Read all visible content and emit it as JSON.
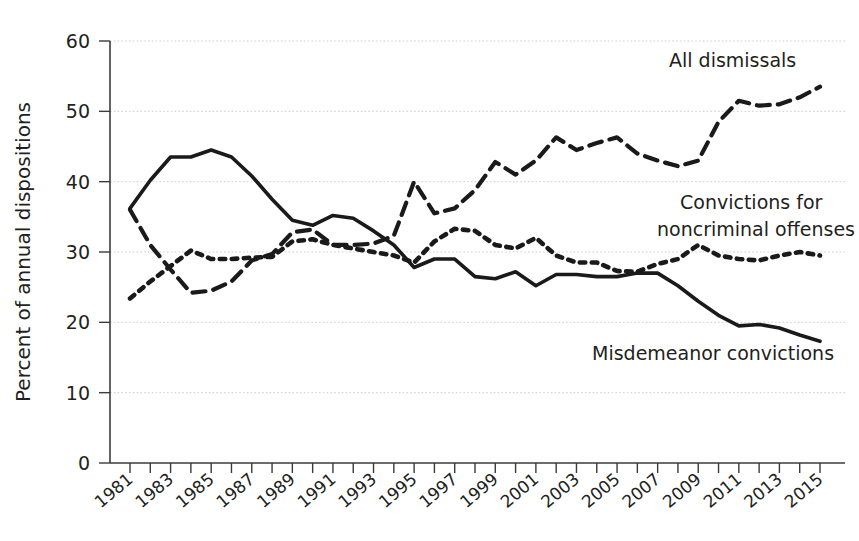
{
  "chart_data": {
    "type": "line",
    "title": "",
    "xlabel": "",
    "ylabel": "Percent of annual dispositions",
    "ylim": [
      0,
      60
    ],
    "yticks": [
      0,
      10,
      20,
      30,
      40,
      50,
      60
    ],
    "xlim": [
      1981,
      2015
    ],
    "grid": true,
    "legend_position": "inline-annotations",
    "x": [
      1981,
      1982,
      1983,
      1984,
      1985,
      1986,
      1987,
      1988,
      1989,
      1990,
      1991,
      1992,
      1993,
      1994,
      1995,
      1996,
      1997,
      1998,
      1999,
      2000,
      2001,
      2002,
      2003,
      2004,
      2005,
      2006,
      2007,
      2008,
      2009,
      2010,
      2011,
      2012,
      2013,
      2014,
      2015
    ],
    "xtick_labels": [
      "1981",
      "1982",
      "1983",
      "1984",
      "1985",
      "1986",
      "1987",
      "1988",
      "1989",
      "1990",
      "1991",
      "1992",
      "1993",
      "1994",
      "1995",
      "1996",
      "1997",
      "1998",
      "1999",
      "2000",
      "2001",
      "2002",
      "2003",
      "2004",
      "2005",
      "2006",
      "2007",
      "2008",
      "2009",
      "2010",
      "2011",
      "2012",
      "2013",
      "2014",
      "2015"
    ],
    "xtick_labels_shown": [
      "1981",
      "1983",
      "1985",
      "1987",
      "1989",
      "1991",
      "1993",
      "1995",
      "1997",
      "1999",
      "2001",
      "2003",
      "2005",
      "2007",
      "2009",
      "2011",
      "2013",
      "2015"
    ],
    "series": [
      {
        "name": "All dismissals",
        "style": "dashed",
        "color": "#1a1a1a",
        "annotation": "All dismissals",
        "values": [
          36.0,
          31.0,
          27.5,
          24.2,
          24.5,
          25.8,
          28.8,
          29.7,
          32.8,
          33.2,
          31.0,
          31.0,
          31.2,
          32.3,
          40.0,
          35.5,
          36.2,
          38.8,
          42.8,
          41.0,
          43.0,
          46.3,
          44.5,
          45.5,
          46.3,
          44.0,
          43.0,
          42.2,
          43.0,
          48.5,
          51.5,
          50.8,
          51.0,
          52.0,
          53.5
        ]
      },
      {
        "name": "Convictions for noncriminal offenses",
        "style": "dotted",
        "color": "#1a1a1a",
        "annotation": "Convictions for\nnoncriminal offenses",
        "values": [
          23.4,
          25.8,
          28.0,
          30.2,
          29.0,
          29.0,
          29.2,
          29.3,
          31.5,
          31.8,
          31.0,
          30.5,
          30.0,
          29.5,
          28.5,
          31.5,
          33.3,
          33.0,
          31.0,
          30.5,
          32.0,
          29.5,
          28.5,
          28.5,
          27.3,
          27.2,
          28.3,
          29.0,
          31.0,
          29.5,
          29.0,
          28.8,
          29.5,
          30.0,
          29.5
        ]
      },
      {
        "name": "Misdemeanor convictions",
        "style": "solid",
        "color": "#1a1a1a",
        "annotation": "Misdemeanor convictions",
        "values": [
          36.2,
          40.2,
          43.5,
          43.5,
          44.5,
          43.5,
          40.8,
          37.5,
          34.5,
          33.8,
          35.2,
          34.8,
          33.0,
          31.0,
          27.8,
          29.0,
          29.0,
          26.5,
          26.2,
          27.2,
          25.2,
          26.8,
          26.8,
          26.5,
          26.5,
          27.0,
          27.0,
          25.2,
          23.0,
          21.0,
          19.5,
          19.7,
          19.2,
          18.2,
          17.3
        ]
      }
    ]
  },
  "annotations": {
    "all_dismissals": "All dismissals",
    "convictions_line1": "Convictions for",
    "convictions_line2": "noncriminal offenses",
    "misdemeanor": "Misdemeanor convictions"
  },
  "axes": {
    "y_title": "Percent of annual dispositions"
  }
}
